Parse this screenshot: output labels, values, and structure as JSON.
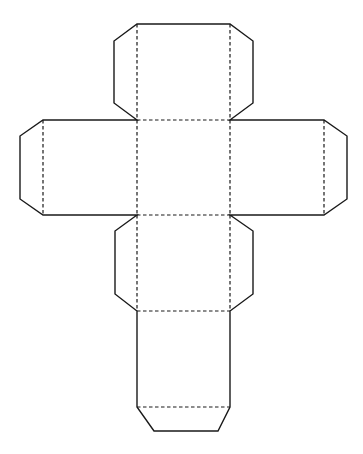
{
  "diagram": {
    "type": "cube-net",
    "faces": [
      {
        "id": "top",
        "x": 137,
        "y": 24,
        "w": 93,
        "h": 96
      },
      {
        "id": "left",
        "x": 43,
        "y": 120,
        "w": 94,
        "h": 95
      },
      {
        "id": "center",
        "x": 137,
        "y": 120,
        "w": 93,
        "h": 95
      },
      {
        "id": "right",
        "x": 230,
        "y": 120,
        "w": 94,
        "h": 95
      },
      {
        "id": "lower",
        "x": 137,
        "y": 215,
        "w": 93,
        "h": 96
      },
      {
        "id": "bottom",
        "x": 137,
        "y": 311,
        "w": 93,
        "h": 96
      }
    ],
    "line_color": "#1a1a1a",
    "background": "#ffffff",
    "legend": {
      "cut_line": "solid",
      "fold_line": "dashed"
    }
  }
}
